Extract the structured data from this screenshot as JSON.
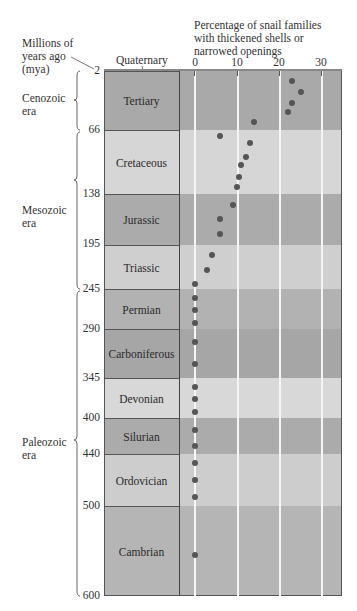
{
  "labels": {
    "y_title_line1": "Millions of",
    "y_title_line2": "years ago",
    "y_title_line3": "(mya)",
    "x_title_line1": "Percentage of snail families",
    "x_title_line2": "with thickened shells or",
    "x_title_line3": "narrowed openings",
    "quaternary": "Quaternary"
  },
  "eras": [
    {
      "name_line1": "Cenozoic",
      "name_line2": "era"
    },
    {
      "name_line1": "Mesozoic",
      "name_line2": "era"
    },
    {
      "name_line1": "Paleozoic",
      "name_line2": "era"
    }
  ],
  "periods": [
    {
      "name": "Tertiary",
      "top_mya": "2",
      "color": "#a9a9a9"
    },
    {
      "name": "Cretaceous",
      "top_mya": "66",
      "color": "#d6d6d6"
    },
    {
      "name": "Jurassic",
      "top_mya": "138",
      "color": "#ababab"
    },
    {
      "name": "Triassic",
      "top_mya": "195",
      "color": "#cfcfcf"
    },
    {
      "name": "Permian",
      "top_mya": "245",
      "color": "#b2b2b2"
    },
    {
      "name": "Carboniferous",
      "top_mya": "290",
      "color": "#a6a6a6"
    },
    {
      "name": "Devonian",
      "top_mya": "345",
      "color": "#d8d8d8"
    },
    {
      "name": "Silurian",
      "top_mya": "400",
      "color": "#ababab"
    },
    {
      "name": "Ordovician",
      "top_mya": "440",
      "color": "#cdcdcd"
    },
    {
      "name": "Cambrian",
      "top_mya": "500",
      "color": "#b5b5b5"
    }
  ],
  "bottom_mya": "600",
  "x_ticks": [
    "0",
    "10",
    "20",
    "30"
  ],
  "chart_data": {
    "type": "scatter",
    "title": "Percentage of snail families with thickened shells or narrowed openings",
    "xlabel": "Percentage of snail families with thickened shells or narrowed openings",
    "ylabel": "Millions of years ago (mya)",
    "xlim": [
      0,
      35
    ],
    "ylim": [
      600,
      0
    ],
    "x_ticks": [
      0,
      10,
      20,
      30
    ],
    "y_ticks": [
      2,
      66,
      138,
      195,
      245,
      290,
      345,
      400,
      440,
      500,
      600
    ],
    "grid": "vertical lines at 0,10,20,30",
    "period_bands": [
      {
        "name": "Quaternary",
        "from_mya": 0,
        "to_mya": 2
      },
      {
        "name": "Tertiary",
        "from_mya": 2,
        "to_mya": 66
      },
      {
        "name": "Cretaceous",
        "from_mya": 66,
        "to_mya": 138
      },
      {
        "name": "Jurassic",
        "from_mya": 138,
        "to_mya": 195
      },
      {
        "name": "Triassic",
        "from_mya": 195,
        "to_mya": 245
      },
      {
        "name": "Permian",
        "from_mya": 245,
        "to_mya": 290
      },
      {
        "name": "Carboniferous",
        "from_mya": 290,
        "to_mya": 345
      },
      {
        "name": "Devonian",
        "from_mya": 345,
        "to_mya": 400
      },
      {
        "name": "Silurian",
        "from_mya": 400,
        "to_mya": 440
      },
      {
        "name": "Ordovician",
        "from_mya": 440,
        "to_mya": 500
      },
      {
        "name": "Cambrian",
        "from_mya": 500,
        "to_mya": 600
      }
    ],
    "eras": [
      {
        "name": "Cenozoic era",
        "from_mya": 2,
        "to_mya": 66
      },
      {
        "name": "Mesozoic era",
        "from_mya": 66,
        "to_mya": 245
      },
      {
        "name": "Paleozoic era",
        "from_mya": 245,
        "to_mya": 600
      }
    ],
    "points": [
      {
        "period": "Tertiary",
        "y_px": 81,
        "percent": 23
      },
      {
        "period": "Tertiary",
        "y_px": 92,
        "percent": 25
      },
      {
        "period": "Tertiary",
        "y_px": 103,
        "percent": 23
      },
      {
        "period": "Tertiary",
        "y_px": 112,
        "percent": 22
      },
      {
        "period": "Tertiary",
        "y_px": 122,
        "percent": 14
      },
      {
        "period": "Cretaceous",
        "y_px": 136,
        "percent": 6
      },
      {
        "period": "Cretaceous",
        "y_px": 143,
        "percent": 13
      },
      {
        "period": "Cretaceous",
        "y_px": 157,
        "percent": 12
      },
      {
        "period": "Cretaceous",
        "y_px": 165,
        "percent": 11
      },
      {
        "period": "Cretaceous",
        "y_px": 177,
        "percent": 10.5
      },
      {
        "period": "Cretaceous",
        "y_px": 187,
        "percent": 10
      },
      {
        "period": "Jurassic",
        "y_px": 205,
        "percent": 9
      },
      {
        "period": "Jurassic",
        "y_px": 219,
        "percent": 6
      },
      {
        "period": "Jurassic",
        "y_px": 234,
        "percent": 6
      },
      {
        "period": "Triassic",
        "y_px": 255,
        "percent": 4
      },
      {
        "period": "Triassic",
        "y_px": 270,
        "percent": 3
      },
      {
        "period": "Permian",
        "y_px": 284,
        "percent": 0
      },
      {
        "period": "Permian",
        "y_px": 298,
        "percent": 0
      },
      {
        "period": "Permian",
        "y_px": 310,
        "percent": 0
      },
      {
        "period": "Permian",
        "y_px": 323,
        "percent": 0
      },
      {
        "period": "Carboniferous",
        "y_px": 342,
        "percent": 0
      },
      {
        "period": "Carboniferous",
        "y_px": 364,
        "percent": 0
      },
      {
        "period": "Devonian",
        "y_px": 387,
        "percent": 0
      },
      {
        "period": "Devonian",
        "y_px": 399,
        "percent": 0
      },
      {
        "period": "Devonian",
        "y_px": 412,
        "percent": 0
      },
      {
        "period": "Silurian",
        "y_px": 430,
        "percent": 0
      },
      {
        "period": "Silurian",
        "y_px": 446,
        "percent": 0
      },
      {
        "period": "Ordovician",
        "y_px": 463,
        "percent": 0
      },
      {
        "period": "Ordovician",
        "y_px": 480,
        "percent": 0
      },
      {
        "period": "Ordovician",
        "y_px": 497,
        "percent": 0
      },
      {
        "period": "Cambrian",
        "y_px": 555,
        "percent": 0
      }
    ]
  }
}
